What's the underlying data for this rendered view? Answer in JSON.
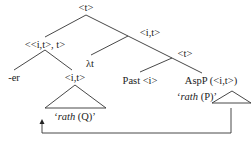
{
  "tree": {
    "root": "<t>",
    "left_node": "<<i,t>, t>",
    "right_node": "<i,t>",
    "lambda": "λt",
    "inner_t": "<t>",
    "er": "-er",
    "it_node": "<i,t>",
    "q_quote_open": "‘",
    "q_word": "rath",
    "q_tail": " (Q)’",
    "past": "Past <i>",
    "aspp": "AspP (<i,t>)",
    "p_quote_open": "‘",
    "p_word": "rath",
    "p_tail": " (P)’"
  }
}
